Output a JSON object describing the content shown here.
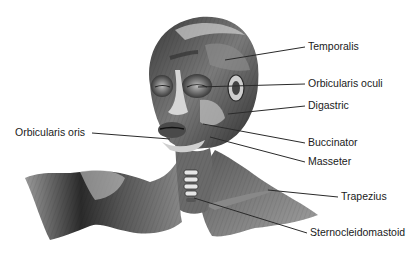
{
  "figure": {
    "colors": {
      "background": "#ffffff",
      "label_text": "#1a1a1a",
      "leader_line": "#2a2a2a",
      "muscle_dark": "#2b2b2b",
      "muscle_mid": "#6e6e6e",
      "muscle_light": "#bdbdbd"
    },
    "labels": [
      {
        "id": "temporalis",
        "text": "Temporalis",
        "x": 308,
        "y": 41,
        "line": [
          225,
          60,
          305,
          47
        ]
      },
      {
        "id": "orbicularis-oculi",
        "text": "Orbicularis oculi",
        "x": 308,
        "y": 78,
        "line": [
          198,
          87,
          305,
          84
        ]
      },
      {
        "id": "digastric",
        "text": "Digastric",
        "x": 308,
        "y": 100,
        "line": [
          228,
          114,
          305,
          106
        ]
      },
      {
        "id": "buccinator",
        "text": "Buccinator",
        "x": 308,
        "y": 137,
        "line": [
          203,
          124,
          305,
          143
        ]
      },
      {
        "id": "masseter",
        "text": "Masseter",
        "x": 308,
        "y": 156,
        "line": [
          210,
          137,
          305,
          162
        ]
      },
      {
        "id": "trapezius",
        "text": "Trapezius",
        "x": 341,
        "y": 191,
        "line": [
          268,
          190,
          338,
          197
        ]
      },
      {
        "id": "sternocleidomastoid",
        "text": "Sternocleidomastoid",
        "x": 310,
        "y": 227,
        "line": [
          194,
          198,
          307,
          233
        ]
      },
      {
        "id": "orbicularis-oris",
        "text": "Orbicularis oris",
        "x": 15,
        "y": 127,
        "line": [
          92,
          133,
          170,
          139
        ]
      }
    ]
  }
}
